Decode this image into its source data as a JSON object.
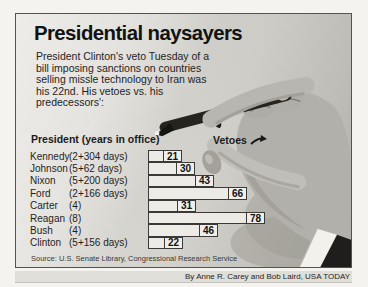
{
  "title": "Presidential naysayers",
  "intro": "President Clinton's veto Tuesday of a bill imposing sanctions on countries selling missle technology to Iran was his 22nd. His vetoes vs. his predecessors':",
  "chart": {
    "col_president": "President (years in office)",
    "col_vetoes": "Vetoes",
    "max_value": 78,
    "rows": [
      {
        "name": "Kennedy",
        "years": "(2+304 days)",
        "value": 21
      },
      {
        "name": "Johnson",
        "years": "(5+62 days)",
        "value": 30
      },
      {
        "name": "Nixon",
        "years": "(5+200 days)",
        "value": 43
      },
      {
        "name": "Ford",
        "years": "(2+166 days)",
        "value": 66
      },
      {
        "name": "Carter",
        "years": "(4)",
        "value": 31
      },
      {
        "name": "Reagan",
        "years": "(8)",
        "value": 78
      },
      {
        "name": "Bush",
        "years": "(4)",
        "value": 46
      },
      {
        "name": "Clinton",
        "years": "(5+156 days)",
        "value": 22
      }
    ]
  },
  "source": "Source: U.S. Senate Library, Congressional Research Service",
  "credit": "By Anne R. Carey and Bob Laird, USA TODAY",
  "colors": {
    "bar_fill": "#f0eee8",
    "bar_border": "#3c3a38",
    "box_background": "#d2d0ca",
    "text": "#1b1b1b"
  },
  "chart_data": {
    "type": "bar",
    "orientation": "horizontal",
    "title": "Presidential naysayers",
    "subtitle": "President Clinton's veto Tuesday of a bill imposing sanctions on countries selling missle technology to Iran was his 22nd. His vetoes vs. his predecessors':",
    "categories": [
      "Kennedy (2+304 days)",
      "Johnson (5+62 days)",
      "Nixon (5+200 days)",
      "Ford (2+166 days)",
      "Carter (4)",
      "Reagan (8)",
      "Bush (4)",
      "Clinton (5+156 days)"
    ],
    "values": [
      21,
      30,
      43,
      66,
      31,
      78,
      46,
      22
    ],
    "xlabel": "Vetoes",
    "ylabel": "President (years in office)",
    "xlim": [
      0,
      80
    ],
    "data_labels": true,
    "grid": false,
    "legend": false,
    "source": "Source: U.S. Senate Library, Congressional Research Service",
    "credit": "By Anne R. Carey and Bob Laird, USA TODAY"
  }
}
